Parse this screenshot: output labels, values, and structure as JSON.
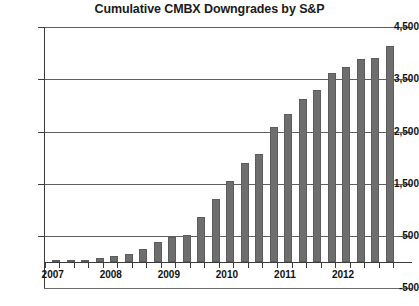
{
  "chart_data": {
    "type": "bar",
    "title": "Cumulative CMBX Downgrades by S&P",
    "xlabel": "",
    "ylabel": "",
    "ylim": [
      -500,
      4500
    ],
    "ytick_labels": [
      "4,500",
      "3,500",
      "2,500",
      "1,500",
      "500",
      "-500"
    ],
    "ytick_values": [
      4500,
      3500,
      2500,
      1500,
      500,
      -500
    ],
    "grid": true,
    "legend": "none",
    "x_axis_labels": [
      "2007",
      "2008",
      "2009",
      "2010",
      "2011",
      "2012"
    ],
    "categories": [
      "2007 Q1",
      "2007 Q2",
      "2007 Q3",
      "2007 Q4",
      "2008 Q1",
      "2008 Q2",
      "2008 Q3",
      "2008 Q4",
      "2009 Q1",
      "2009 Q2",
      "2009 Q3",
      "2009 Q4",
      "2010 Q1",
      "2010 Q2",
      "2010 Q3",
      "2010 Q4",
      "2011 Q1",
      "2011 Q2",
      "2011 Q3",
      "2011 Q4",
      "2012 Q1",
      "2012 Q2",
      "2012 Q3",
      "2012 Q4"
    ],
    "values": [
      10,
      30,
      45,
      70,
      110,
      160,
      250,
      380,
      470,
      520,
      870,
      1200,
      1560,
      1900,
      2060,
      2580,
      2840,
      3120,
      3300,
      3620,
      3740,
      3880,
      3900,
      4130
    ],
    "bar_color": "#6e6e6e",
    "axis_color": "#3b3b3b",
    "grid_color": "#5f5f5f",
    "background_color": "#ffffff"
  }
}
